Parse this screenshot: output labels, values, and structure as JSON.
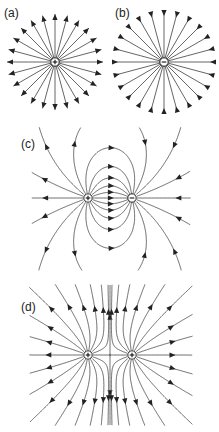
{
  "figure": {
    "panels": [
      {
        "label": "(a)",
        "description": "Isolated positive charge, field lines radiating outward",
        "charges": [
          {
            "sign": "+"
          }
        ]
      },
      {
        "label": "(b)",
        "description": "Isolated negative charge, field lines pointing inward",
        "charges": [
          {
            "sign": "−"
          }
        ]
      },
      {
        "label": "(c)",
        "description": "Electric dipole: positive and negative charge",
        "charges": [
          {
            "sign": "+"
          },
          {
            "sign": "−"
          }
        ]
      },
      {
        "label": "(d)",
        "description": "Two equal positive charges",
        "charges": [
          {
            "sign": "+"
          },
          {
            "sign": "+"
          }
        ]
      }
    ]
  },
  "colors": {
    "line": "#555555",
    "arrow": "#222222",
    "background": "#ffffff"
  }
}
